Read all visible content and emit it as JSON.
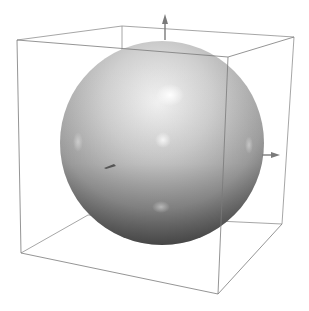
{
  "scene": {
    "type": "3d-render",
    "background": "#ffffff",
    "object": "sphere",
    "bounding_box": "wireframe-cube",
    "box_color": "#8a8a8a",
    "sphere_colors": {
      "highlight": "#f4f4f4",
      "mid": "#bdbdbd",
      "shadow": "#5e5e5e"
    },
    "axis_arrows": [
      "up-arrow",
      "right-arrow",
      "depth-arrow"
    ]
  }
}
